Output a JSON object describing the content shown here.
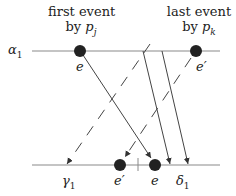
{
  "diagram": {
    "top_line": {
      "label": "α",
      "label_sub": "1",
      "y": 51,
      "x1": 32,
      "x2": 220
    },
    "bottom_line": {
      "y": 165,
      "x1": 32,
      "x2": 220
    },
    "top_annotations": [
      {
        "line1": "first event",
        "line2_prefix": "by ",
        "line2_var": "p",
        "line2_sub": "j"
      },
      {
        "line1": "last event",
        "line2_prefix": "by ",
        "line2_var": "p",
        "line2_sub": "k"
      }
    ],
    "top_events": [
      {
        "label": "e",
        "x": 80
      },
      {
        "label": "e′",
        "x": 196
      }
    ],
    "bottom_events": [
      {
        "label": "e′",
        "x": 120
      },
      {
        "label": "e",
        "x": 155
      }
    ],
    "bottom_labels": [
      {
        "label": "γ",
        "sub": "1",
        "x": 66
      },
      {
        "label": "δ",
        "sub": "1",
        "x": 180
      }
    ],
    "messages": [
      {
        "style": "solid",
        "from": [
          80,
          51
        ],
        "to": [
          152,
          160
        ]
      },
      {
        "style": "solid",
        "from": [
          143,
          51
        ],
        "to": [
          170,
          165
        ]
      },
      {
        "style": "solid",
        "from": [
          162,
          51
        ],
        "to": [
          188,
          165
        ]
      },
      {
        "style": "dashed",
        "from": [
          150,
          44
        ],
        "to": [
          66,
          165
        ]
      },
      {
        "style": "dashed",
        "from": [
          192,
          58
        ],
        "to": [
          124,
          158
        ]
      }
    ],
    "colors": {
      "line": "#7a7a7a",
      "arrow": "#333333",
      "dot": "#222222"
    }
  }
}
